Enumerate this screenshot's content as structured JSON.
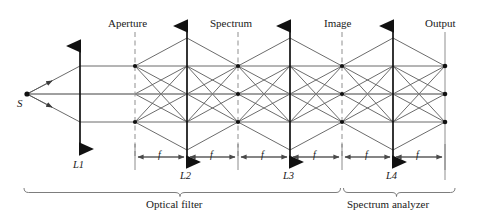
{
  "figure": {
    "type": "optical-ray-diagram",
    "background_color": "#ffffff",
    "ray_color": "#555555",
    "axis_color": "#707070",
    "lens_color": "#111111",
    "plane_color": "#888888"
  },
  "source": {
    "label": "S",
    "x": 27,
    "y": 94
  },
  "lenses": [
    {
      "id": "L1",
      "label": "L1",
      "x": 80,
      "top": 40,
      "bottom": 155
    },
    {
      "id": "L2",
      "label": "L2",
      "x": 187,
      "top": 20,
      "bottom": 168
    },
    {
      "id": "L3",
      "label": "L3",
      "x": 290,
      "top": 20,
      "bottom": 168
    },
    {
      "id": "L4",
      "label": "L4",
      "x": 393,
      "top": 20,
      "bottom": 168
    }
  ],
  "planes": [
    {
      "id": "aperture",
      "label": "Aperture",
      "x": 135,
      "style": "dashed",
      "top": 32,
      "bottom": 156,
      "dots": [
        66,
        122
      ]
    },
    {
      "id": "spectrum",
      "label": "Spectrum",
      "x": 238,
      "style": "dashed",
      "top": 32,
      "bottom": 156,
      "dots": [
        66,
        94,
        122
      ]
    },
    {
      "id": "image",
      "label": "Image",
      "x": 342,
      "style": "dashed",
      "top": 32,
      "bottom": 156,
      "dots": [
        66,
        94,
        122
      ]
    },
    {
      "id": "output",
      "label": "Output",
      "x": 445,
      "style": "solid",
      "top": 32,
      "bottom": 180,
      "dots": [
        66,
        94,
        122
      ]
    }
  ],
  "ray_heights": {
    "upper": 66,
    "axis": 94,
    "lower": 122
  },
  "dimensions": {
    "line_y": 157,
    "tick_label": "f",
    "segments": [
      {
        "from": 135,
        "to": 187,
        "label": "f"
      },
      {
        "from": 187,
        "to": 238,
        "label": "f"
      },
      {
        "from": 238,
        "to": 290,
        "label": "f"
      },
      {
        "from": 290,
        "to": 342,
        "label": "f"
      },
      {
        "from": 342,
        "to": 393,
        "label": "f"
      },
      {
        "from": 393,
        "to": 445,
        "label": "f"
      }
    ]
  },
  "groups": [
    {
      "id": "optical-filter",
      "label": "Optical filter",
      "from": 24,
      "to": 340,
      "y": 192
    },
    {
      "id": "spectrum-analyzer",
      "label": "Spectrum analyzer",
      "from": 342,
      "to": 455,
      "y": 192
    }
  ],
  "labels": {
    "aperture": "Aperture",
    "spectrum": "Spectrum",
    "image": "Image",
    "output": "Output",
    "source": "S",
    "l1": "L1",
    "l2": "L2",
    "l3": "L3",
    "l4": "L4",
    "f": "f",
    "optical_filter": "Optical filter",
    "spectrum_analyzer": "Spectrum analyzer"
  }
}
